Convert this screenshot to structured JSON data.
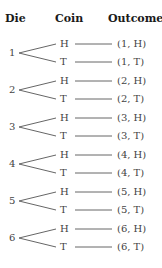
{
  "headers": {
    "die": "Die",
    "coin": "Coin",
    "outcome": "Outcome"
  },
  "groups": [
    {
      "die": "1",
      "branches": [
        {
          "coin": "H",
          "outcome": "(1, H)"
        },
        {
          "coin": "T",
          "outcome": "(1, T)"
        }
      ]
    },
    {
      "die": "2",
      "branches": [
        {
          "coin": "H",
          "outcome": "(2, H)"
        },
        {
          "coin": "T",
          "outcome": "(2, T)"
        }
      ]
    },
    {
      "die": "3",
      "branches": [
        {
          "coin": "H",
          "outcome": "(3, H)"
        },
        {
          "coin": "T",
          "outcome": "(3, T)"
        }
      ]
    },
    {
      "die": "4",
      "branches": [
        {
          "coin": "H",
          "outcome": "(4, H)"
        },
        {
          "coin": "T",
          "outcome": "(4, T)"
        }
      ]
    },
    {
      "die": "5",
      "branches": [
        {
          "coin": "H",
          "outcome": "(5, H)"
        },
        {
          "coin": "T",
          "outcome": "(5, T)"
        }
      ]
    },
    {
      "die": "6",
      "branches": [
        {
          "coin": "H",
          "outcome": "(6, H)"
        },
        {
          "coin": "T",
          "outcome": "(6, T)"
        }
      ]
    }
  ],
  "colors": {
    "line": "#666666",
    "text": "#444444",
    "header": "#1a1a1a"
  }
}
